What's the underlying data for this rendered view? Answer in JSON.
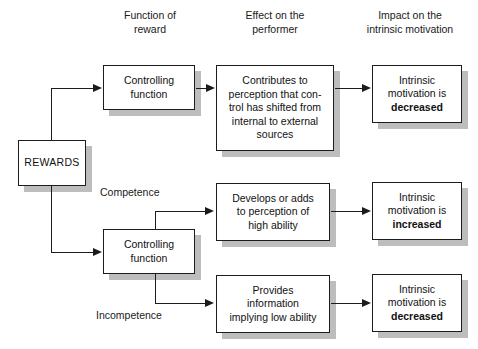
{
  "diagram": {
    "column_headers": [
      {
        "id": "function-of-reward",
        "label": "Function of\nreward"
      },
      {
        "id": "effect-on-performer",
        "label": "Effect on the\nperformer"
      },
      {
        "id": "impact-on-intrinsic-motivation",
        "label": "Impact on the\nintrinsic motivation"
      }
    ],
    "source_node": {
      "id": "rewards",
      "label": "REWARDS"
    },
    "function_nodes": [
      {
        "id": "controlling-function-top",
        "label": "Controlling\nfunction"
      },
      {
        "id": "controlling-function-bottom",
        "label": "Controlling\nfunction"
      }
    ],
    "effect_nodes": [
      {
        "id": "effect-control-shifted",
        "label": "Contributes to\nperception that con-\ntrol has shifted from\ninternal to external\nsources"
      },
      {
        "id": "effect-high-ability",
        "label": "Develops or adds\nto perception of\nhigh ability"
      },
      {
        "id": "effect-low-ability",
        "label": "Provides\ninformation\nimplying low ability"
      }
    ],
    "impact_nodes": [
      {
        "id": "impact-decreased-top",
        "prefix": "Intrinsic\nmotivation is\n",
        "emphasis": "decreased"
      },
      {
        "id": "impact-increased",
        "prefix": "Intrinsic\nmotivation is\n",
        "emphasis": "increased"
      },
      {
        "id": "impact-decreased-bottom",
        "prefix": "Intrinsic\nmotivation is\n",
        "emphasis": "decreased"
      }
    ],
    "edge_labels": [
      {
        "id": "competence",
        "label": "Competence"
      },
      {
        "id": "incompetence",
        "label": "Incompetence"
      }
    ],
    "colors": {
      "stroke": "#1c1c1c",
      "shadow": "#bdbdbd",
      "background": "#ffffff",
      "text": "#111111"
    }
  }
}
